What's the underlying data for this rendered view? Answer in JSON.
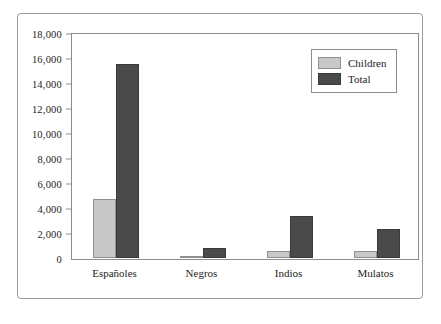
{
  "chart_data": {
    "type": "bar",
    "title": "",
    "xlabel": "",
    "ylabel": "",
    "categories": [
      "Españoles",
      "Negros",
      "Indios",
      "Mulatos"
    ],
    "series": [
      {
        "name": "Children",
        "color": "#c8c8c8",
        "values": [
          4700,
          150,
          600,
          600
        ]
      },
      {
        "name": "Total",
        "color": "#4a4a4a",
        "values": [
          15500,
          800,
          3400,
          2300
        ]
      }
    ],
    "ylim": [
      0,
      18000
    ],
    "ytick_values": [
      0,
      2000,
      4000,
      6000,
      8000,
      10000,
      12000,
      14000,
      16000,
      18000
    ],
    "ytick_labels": [
      "0",
      "2,000",
      "4,000",
      "6,000",
      "8,000",
      "10,000",
      "12,000",
      "14,000",
      "16,000",
      "18,000"
    ],
    "grid": false,
    "legend_position": "top-right",
    "legend_entries": [
      "Children",
      "Total"
    ]
  }
}
